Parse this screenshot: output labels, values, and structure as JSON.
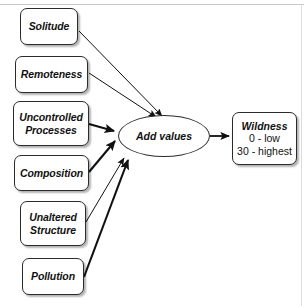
{
  "diagram": {
    "background_color": "#ffffff",
    "line_color": "#1a1a1a",
    "node_border_color": "#2b2b2b",
    "inputs": [
      {
        "id": "solitude",
        "label": "Solitude"
      },
      {
        "id": "remoteness",
        "label": "Remoteness"
      },
      {
        "id": "uncontrolled-processes",
        "label": "Uncontrolled Processes",
        "line1": "Uncontrolled",
        "line2": "Processes"
      },
      {
        "id": "composition",
        "label": "Composition"
      },
      {
        "id": "unaltered-structure",
        "label": "Unaltered Structure",
        "line1": "Unaltered",
        "line2": "Structure"
      },
      {
        "id": "pollution",
        "label": "Pollution"
      }
    ],
    "process": {
      "id": "add-values",
      "label": "Add values"
    },
    "outcome": {
      "id": "wildness",
      "title": "Wildness",
      "scale_low": "0 - low",
      "scale_high": "30 - highest"
    }
  }
}
